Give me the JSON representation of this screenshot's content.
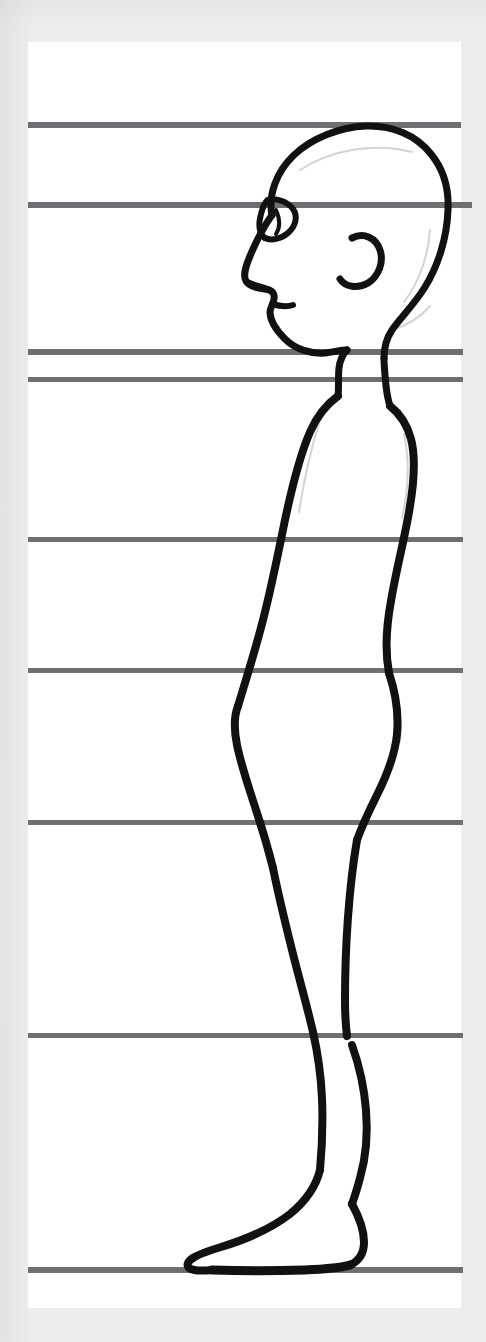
{
  "document": {
    "type": "scanned-drawing",
    "title": "Human figure proportion study - side view",
    "subject": "standing male figure, left-facing profile",
    "medium": "black ink line drawing on white paper",
    "paper": {
      "background_color": "#ffffff",
      "scan_background_color": "#ededee",
      "left": 28,
      "top": 42,
      "width": 433,
      "height": 1266
    }
  },
  "ink": {
    "color": "#111111",
    "label": "black ink contour"
  },
  "guides": {
    "label": "horizontal proportion guide lines",
    "color": "#6f6f72",
    "count": 9,
    "lines": [
      {
        "name": "top-of-head-line",
        "y": 125,
        "x1": 28,
        "x2": 461,
        "thickness": 6,
        "note": "crown of skull"
      },
      {
        "name": "brow-eye-line",
        "y": 205,
        "x1": 28,
        "x2": 472,
        "thickness": 6,
        "note": "eye / brow level"
      },
      {
        "name": "chin-line",
        "y": 352,
        "x1": 28,
        "x2": 463,
        "thickness": 6,
        "note": "base of chin"
      },
      {
        "name": "shoulder-line",
        "y": 379,
        "x1": 28,
        "x2": 463,
        "thickness": 5,
        "note": "top of shoulder"
      },
      {
        "name": "nipple-chest-line",
        "y": 539,
        "x1": 28,
        "x2": 463,
        "thickness": 5,
        "note": "chest"
      },
      {
        "name": "navel-waist-line",
        "y": 670,
        "x1": 28,
        "x2": 463,
        "thickness": 5,
        "note": "waist / navel"
      },
      {
        "name": "crotch-hip-line",
        "y": 822,
        "x1": 28,
        "x2": 463,
        "thickness": 5,
        "note": "hip / crotch"
      },
      {
        "name": "knee-line",
        "y": 1035,
        "x1": 28,
        "x2": 463,
        "thickness": 5,
        "note": "knee"
      },
      {
        "name": "ground-baseline",
        "y": 1270,
        "x1": 28,
        "x2": 463,
        "thickness": 6,
        "note": "ground / sole of foot"
      }
    ]
  },
  "figure": {
    "name": "profile-figure",
    "facing": "left",
    "parts": [
      {
        "name": "head-outline",
        "description": "bald skull in profile"
      },
      {
        "name": "eye",
        "description": "almond eye with lid"
      },
      {
        "name": "nose",
        "description": "small pointed nose"
      },
      {
        "name": "mouth",
        "description": "short lip line"
      },
      {
        "name": "ear",
        "description": "C-shaped ear"
      },
      {
        "name": "neck",
        "description": "short neck"
      },
      {
        "name": "chest-back",
        "description": "torso front and back contour"
      },
      {
        "name": "abdomen",
        "description": "rounded belly"
      },
      {
        "name": "buttock",
        "description": "curved seat"
      },
      {
        "name": "thigh",
        "description": "upper leg"
      },
      {
        "name": "calf",
        "description": "lower leg"
      },
      {
        "name": "foot",
        "description": "foot resting on baseline"
      }
    ]
  }
}
